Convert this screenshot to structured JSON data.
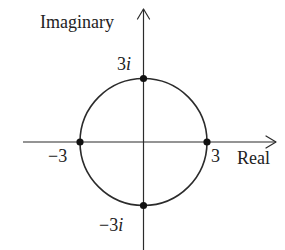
{
  "diagram": {
    "type": "complex-plane",
    "title": "",
    "axes": {
      "x": {
        "label": "Real",
        "range": [
          -4,
          4
        ]
      },
      "y": {
        "label": "Imaginary",
        "range": [
          -4,
          4
        ]
      }
    },
    "circle": {
      "center": [
        0,
        0
      ],
      "radius": 3,
      "equation": "|z| = 3"
    },
    "points": [
      {
        "name": "top",
        "re": 0,
        "im": 3,
        "label_num": "3",
        "label_i": "i",
        "label_sign": ""
      },
      {
        "name": "bottom",
        "re": 0,
        "im": -3,
        "label_num": "3",
        "label_i": "i",
        "label_sign": "−"
      },
      {
        "name": "left",
        "re": -3,
        "im": 0,
        "label_num": "3",
        "label_i": "",
        "label_sign": "−"
      },
      {
        "name": "right",
        "re": 3,
        "im": 0,
        "label_num": "3",
        "label_i": "",
        "label_sign": ""
      }
    ],
    "labels": {
      "imaginary_axis": "Imaginary",
      "real_axis": "Real",
      "top_point_number": "3",
      "top_point_unit": "i",
      "bottom_point_sign": "−",
      "bottom_point_number": "3",
      "bottom_point_unit": "i",
      "left_point": "−3",
      "right_point": "3"
    },
    "colors": {
      "stroke": "#2b2b2b",
      "dot": "#111111",
      "text": "#222222",
      "background": "#ffffff"
    }
  }
}
